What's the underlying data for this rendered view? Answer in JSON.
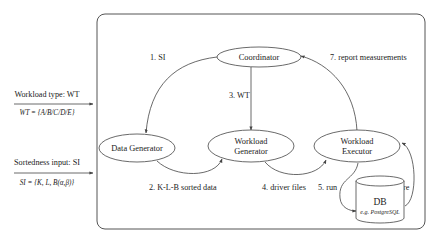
{
  "inputs": {
    "workload": {
      "label": "Workload type: WT",
      "definition": "WT = {A/B/C/D/E}"
    },
    "sortedness": {
      "label": "Sortedness input: SI",
      "definition": "SI = {K, L, B(α,β)}"
    }
  },
  "nodes": {
    "coordinator": {
      "label": "Coordinator"
    },
    "data_generator": {
      "label": "Data Generator"
    },
    "workload_generator": {
      "line1": "Workload",
      "line2": "Generator"
    },
    "workload_executor": {
      "line1": "Workload",
      "line2": "Executor"
    },
    "db": {
      "title": "DB",
      "subtitle": "e.g. PostgreSQL"
    }
  },
  "edges": {
    "e1": "1. SI",
    "e2": "2. K-L-B sorted data",
    "e3": "3. WT",
    "e4": "4. driver files",
    "e5": "5. run",
    "e6": "6. measure",
    "e7": "7. report measurements"
  },
  "colors": {
    "stroke": "#444444",
    "text": "#222222",
    "background": "#ffffff"
  }
}
